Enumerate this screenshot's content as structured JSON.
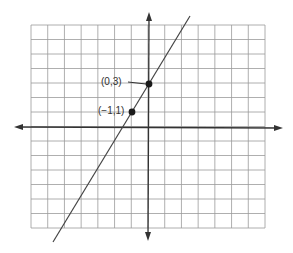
{
  "diagram": {
    "type": "coordinate-plane-line",
    "grid": {
      "columns": 14,
      "rows": 14,
      "x_range": [
        -7,
        7
      ],
      "y_range": [
        -7,
        7
      ]
    },
    "axes": {
      "x_axis": "horizontal with arrows both ends",
      "y_axis": "vertical with arrows both ends"
    },
    "line": {
      "slope": 2,
      "y_intercept": 3,
      "equation": "y = 2x + 3"
    },
    "points": [
      {
        "label": "(0,3)",
        "x": 0,
        "y": 3
      },
      {
        "label": "(−1,1)",
        "x": -1,
        "y": 1
      }
    ],
    "colors": {
      "grid": "#9a9a9a",
      "axis": "#333333",
      "line": "#444444",
      "point": "#1a1a1a",
      "text": "#333333"
    }
  }
}
